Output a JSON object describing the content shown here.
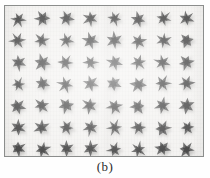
{
  "figure": {
    "caption": "(b)",
    "panel_label": "b",
    "kind": "micrograph",
    "border_color": "#8b8d8c",
    "background_color": "#f3f2f0",
    "particle_color": "#4a4a4a",
    "particle_shadow_color": "#b8b7b5"
  },
  "grid": {
    "columns": 8,
    "rows": 7,
    "count": 56,
    "x_start": 17,
    "y_start": 18,
    "x_spacing": 24.1,
    "y_spacing": 21.7,
    "particle_shape": "star-flower"
  },
  "chart_data": {
    "type": "scatter",
    "title": "(b)",
    "xlabel": "",
    "ylabel": "",
    "grid": false,
    "legend": "none",
    "categories": [
      "col1",
      "col2",
      "col3",
      "col4",
      "col5",
      "col6",
      "col7",
      "col8"
    ],
    "series": [
      {
        "name": "row1",
        "values": [
          1,
          1,
          1,
          1,
          1,
          1,
          1,
          1
        ]
      },
      {
        "name": "row2",
        "values": [
          1,
          1,
          1,
          1,
          1,
          1,
          1,
          1
        ]
      },
      {
        "name": "row3",
        "values": [
          1,
          1,
          1,
          1,
          1,
          1,
          1,
          1
        ]
      },
      {
        "name": "row4",
        "values": [
          1,
          1,
          1,
          1,
          1,
          1,
          1,
          1
        ]
      },
      {
        "name": "row5",
        "values": [
          1,
          1,
          1,
          1,
          1,
          1,
          1,
          1
        ]
      },
      {
        "name": "row6",
        "values": [
          1,
          1,
          1,
          1,
          1,
          1,
          1,
          1
        ]
      },
      {
        "name": "row7",
        "values": [
          1,
          1,
          1,
          1,
          1,
          1,
          1,
          1
        ]
      }
    ],
    "xlim": [
      0,
      8
    ],
    "ylim": [
      0,
      7
    ]
  }
}
